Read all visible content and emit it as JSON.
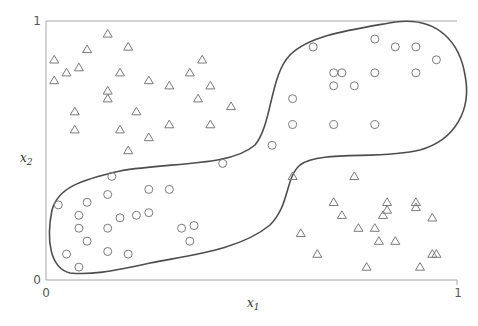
{
  "chart_data": {
    "type": "scatter",
    "title": "",
    "xlabel": "x1",
    "ylabel": "x2",
    "xlim": [
      0,
      1
    ],
    "ylim": [
      0,
      1
    ],
    "x_ticks": [
      "0",
      "1"
    ],
    "y_ticks": [
      "0",
      "1"
    ],
    "grid": false,
    "legend": null,
    "annotations": [
      "Closed decision boundary curve enclosing the circle class (lower-left and upper-right clusters joined by a narrow neck)"
    ],
    "series": [
      {
        "name": "circles",
        "marker": "circle",
        "points": [
          [
            0.65,
            0.9
          ],
          [
            0.8,
            0.93
          ],
          [
            0.85,
            0.9
          ],
          [
            0.9,
            0.9
          ],
          [
            0.95,
            0.85
          ],
          [
            0.7,
            0.8
          ],
          [
            0.72,
            0.8
          ],
          [
            0.8,
            0.8
          ],
          [
            0.9,
            0.8
          ],
          [
            0.7,
            0.75
          ],
          [
            0.75,
            0.75
          ],
          [
            0.6,
            0.7
          ],
          [
            0.6,
            0.6
          ],
          [
            0.7,
            0.6
          ],
          [
            0.8,
            0.6
          ],
          [
            0.55,
            0.52
          ],
          [
            0.43,
            0.45
          ],
          [
            0.16,
            0.4
          ],
          [
            0.15,
            0.33
          ],
          [
            0.25,
            0.35
          ],
          [
            0.3,
            0.35
          ],
          [
            0.03,
            0.29
          ],
          [
            0.1,
            0.3
          ],
          [
            0.08,
            0.25
          ],
          [
            0.18,
            0.24
          ],
          [
            0.22,
            0.25
          ],
          [
            0.25,
            0.26
          ],
          [
            0.08,
            0.2
          ],
          [
            0.15,
            0.2
          ],
          [
            0.1,
            0.15
          ],
          [
            0.33,
            0.2
          ],
          [
            0.36,
            0.21
          ],
          [
            0.35,
            0.15
          ],
          [
            0.05,
            0.1
          ],
          [
            0.15,
            0.11
          ],
          [
            0.2,
            0.1
          ],
          [
            0.08,
            0.05
          ]
        ]
      },
      {
        "name": "triangles",
        "marker": "triangle",
        "points": [
          [
            0.02,
            0.85
          ],
          [
            0.02,
            0.77
          ],
          [
            0.05,
            0.8
          ],
          [
            0.08,
            0.82
          ],
          [
            0.1,
            0.89
          ],
          [
            0.15,
            0.95
          ],
          [
            0.2,
            0.9
          ],
          [
            0.18,
            0.8
          ],
          [
            0.07,
            0.65
          ],
          [
            0.07,
            0.58
          ],
          [
            0.25,
            0.77
          ],
          [
            0.3,
            0.75
          ],
          [
            0.22,
            0.65
          ],
          [
            0.18,
            0.58
          ],
          [
            0.3,
            0.6
          ],
          [
            0.25,
            0.55
          ],
          [
            0.2,
            0.5
          ],
          [
            0.15,
            0.73
          ],
          [
            0.15,
            0.7
          ],
          [
            0.35,
            0.8
          ],
          [
            0.38,
            0.85
          ],
          [
            0.4,
            0.75
          ],
          [
            0.37,
            0.7
          ],
          [
            0.45,
            0.67
          ],
          [
            0.4,
            0.6
          ],
          [
            0.6,
            0.4
          ],
          [
            0.75,
            0.4
          ],
          [
            0.7,
            0.3
          ],
          [
            0.83,
            0.3
          ],
          [
            0.9,
            0.3
          ],
          [
            0.72,
            0.25
          ],
          [
            0.83,
            0.27
          ],
          [
            0.9,
            0.28
          ],
          [
            0.82,
            0.25
          ],
          [
            0.94,
            0.24
          ],
          [
            0.62,
            0.18
          ],
          [
            0.76,
            0.2
          ],
          [
            0.8,
            0.2
          ],
          [
            0.94,
            0.1
          ],
          [
            0.66,
            0.1
          ],
          [
            0.81,
            0.15
          ],
          [
            0.85,
            0.15
          ],
          [
            0.95,
            0.1
          ],
          [
            0.78,
            0.05
          ],
          [
            0.91,
            0.05
          ]
        ]
      }
    ]
  },
  "axes": {
    "x_min_label": "0",
    "x_max_label": "1",
    "y_min_label": "0",
    "y_max_label": "1",
    "x_label_main": "x",
    "x_label_sub": "1",
    "y_label_main": "x",
    "y_label_sub": "2"
  },
  "colors": {
    "axis": "#a6a6a6",
    "marker": "#7a7a7a",
    "boundary": "#4d4d4d"
  }
}
